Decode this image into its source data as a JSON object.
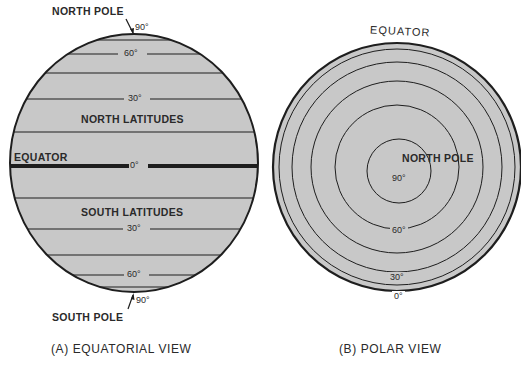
{
  "colors": {
    "fill": "#c8c8c8",
    "line": "#1e1e1e",
    "background": "#ffffff"
  },
  "equatorial_view": {
    "caption": "(A) EQUATORIAL VIEW",
    "north_pole_label": "NORTH POLE",
    "south_pole_label": "SOUTH POLE",
    "north_region_label": "NORTH LATITUDES",
    "south_region_label": "SOUTH LATITUDES",
    "equator_label": "EQUATOR",
    "degree_labels": {
      "north_90": "90°",
      "north_60": "60°",
      "north_30": "30°",
      "equator_0": "0°",
      "south_30": "30°",
      "south_60": "60°",
      "south_90": "90°"
    }
  },
  "polar_view": {
    "caption": "(B) POLAR VIEW",
    "equator_label": "EQUATOR",
    "north_pole_label": "NORTH POLE",
    "degree_labels": {
      "center_90": "90°",
      "ring_60": "60°",
      "ring_30": "30°",
      "ring_0": "0°"
    }
  }
}
